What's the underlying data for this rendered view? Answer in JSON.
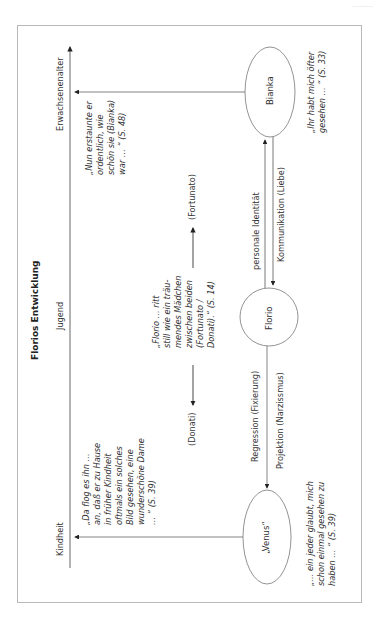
{
  "corner_text": "………",
  "diagram": {
    "title": "Florios Entwicklung",
    "axis": {
      "label_top": "Erwachsenenalter",
      "label_middle": "Jugend",
      "label_bottom": "Kindheit"
    },
    "nodes": {
      "bianka": "Bianka",
      "florio": "Florio",
      "venus": "„Venus“"
    },
    "edges": {
      "personale_identitaet": "personale Identität",
      "kommunikation": "Kommunikation (Liebe)",
      "regression": "Regression (Fixierung)",
      "projektion": "Projektion (Narzissmus)",
      "fortunato": "(Fortunato)",
      "donati": "(Donati)"
    },
    "quotes": {
      "nun_erstaunte": [
        "„Nun erstaunte er",
        "ordentlich, wie",
        "schön sie (Bianka)",
        "war … “ (S. 48)"
      ],
      "ihr_habt": [
        "„Ihr habt mich öfter",
        "gesehen … “ (S. 33)"
      ],
      "florio_ritt": [
        "„Florio … ritt",
        "still wie ein träu-",
        "mendes Mädchen",
        "zwischen beiden",
        "(Fortunato /",
        "Donati).“ (S. 14)"
      ],
      "da_flog": [
        "„Da flog es ihn …",
        "an, daß er zu Hause",
        "in früher Kindheit",
        "oftmals ein solches",
        "Bild gesehen, eine",
        "wunderschöne Dame",
        "… “ (S. 39)"
      ],
      "ein_jeder": [
        "„… ein jeder glaubt, mich",
        "schon einmal gesehen zu",
        "haben … “ (S. 39)"
      ]
    }
  }
}
